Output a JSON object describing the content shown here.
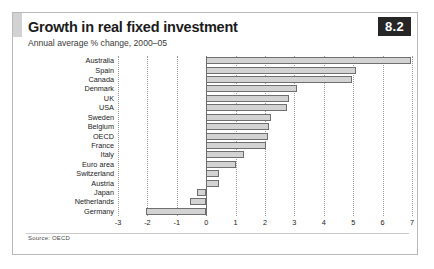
{
  "figure": {
    "badge": "8.2",
    "title": "Growth in real fixed investment",
    "subtitle": "Annual average % change, 2000–05",
    "source": "Source: OECD"
  },
  "chart_data": {
    "type": "bar",
    "orientation": "horizontal",
    "title": "Growth in real fixed investment",
    "subtitle": "Annual average % change, 2000–05",
    "xlabel": "",
    "ylabel": "",
    "xlim": [
      -3,
      7
    ],
    "xticks": [
      -3,
      -2,
      -1,
      0,
      1,
      2,
      3,
      4,
      5,
      6,
      7
    ],
    "xtick_labels": [
      "-3",
      "-2",
      "-1",
      "0",
      "1",
      "2",
      "3",
      "4",
      "5",
      "6",
      "7"
    ],
    "grid": true,
    "legend": false,
    "zero_line": 0,
    "bar_fill": "#d3d3d3",
    "bar_stroke": "#6f6f6f",
    "categories": [
      "Australia",
      "Spain",
      "Canada",
      "Denmark",
      "UK",
      "USA",
      "Sweden",
      "Belgium",
      "OECD",
      "France",
      "Italy",
      "Euro area",
      "Switzerland",
      "Austria",
      "Japan",
      "Netherlands",
      "Germany"
    ],
    "values": [
      6.95,
      5.1,
      4.95,
      3.1,
      2.8,
      2.75,
      2.2,
      2.15,
      2.1,
      2.05,
      1.3,
      1.0,
      0.45,
      0.45,
      -0.3,
      -0.55,
      -2.05
    ],
    "source": "Source: OECD"
  }
}
